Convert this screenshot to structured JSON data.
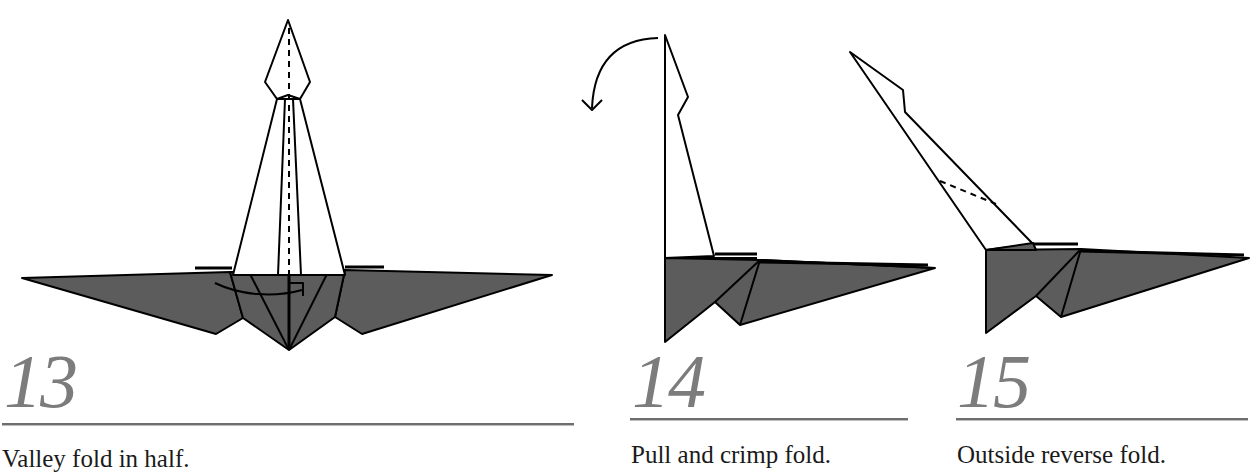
{
  "colors": {
    "paper_fill": "#5c5c5c",
    "line": "#000000",
    "step_number": "#7c7c7c",
    "rule": "#6e6e6e",
    "background": "#ffffff"
  },
  "steps": [
    {
      "number": "13",
      "caption": "Valley fold in half.",
      "symbols": [
        "valley-fold-line",
        "valley-fold-arrow"
      ]
    },
    {
      "number": "14",
      "caption": "Pull and crimp fold.",
      "symbols": [
        "crimp-arrow"
      ]
    },
    {
      "number": "15",
      "caption": "Outside reverse fold.",
      "symbols": [
        "valley-fold-line"
      ]
    }
  ]
}
